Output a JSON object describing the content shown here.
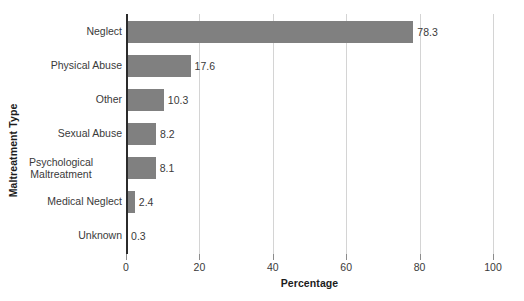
{
  "chart_data": {
    "type": "bar",
    "orientation": "horizontal",
    "title": "",
    "xlabel": "Percentage",
    "ylabel": "Maltreatment Type",
    "categories": [
      "Neglect",
      "Physical Abuse",
      "Other",
      "Sexual Abuse",
      "Psychological Maltreatment",
      "Medical Neglect",
      "Unknown"
    ],
    "values": [
      78.3,
      17.6,
      10.3,
      8.2,
      8.1,
      2.4,
      0.3
    ],
    "value_labels": [
      "78.3",
      "17.6",
      "10.3",
      "8.2",
      "8.1",
      "2.4",
      "0.3"
    ],
    "xlim": [
      0,
      100
    ],
    "xticks": [
      0,
      20,
      40,
      60,
      80,
      100
    ],
    "xtick_labels": [
      "0",
      "20",
      "40",
      "60",
      "80",
      "100"
    ],
    "grid": "vertical",
    "legend": "none",
    "bar_color": "#808080",
    "axis_color": "#2b2b2b",
    "gridline_color": "#d4d4d4",
    "background": "#ffffff"
  }
}
